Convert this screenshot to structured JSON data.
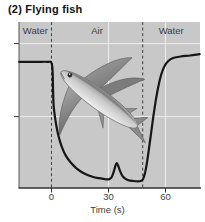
{
  "figure": {
    "title": "(2) Flying fish",
    "x_axis_label": "Time (s)",
    "x_tick_labels": [
      "0",
      "30",
      "60"
    ],
    "illustration": "flying fish"
  },
  "chart_data": {
    "type": "line",
    "title": "(2) Flying fish",
    "xlabel": "Time (s)",
    "ylabel": "",
    "x_ticks": [
      0,
      30,
      60
    ],
    "x_range_s": [
      -17,
      78
    ],
    "grid": true,
    "x_gridlines_s": [
      30,
      60
    ],
    "y_gridlines": [
      87,
      43
    ],
    "phase_boundaries_s": [
      0,
      48
    ],
    "phase_regions": [
      {
        "label": "Water",
        "from_s": -17,
        "to_s": 0
      },
      {
        "label": "Air",
        "from_s": 0,
        "to_s": 48
      },
      {
        "label": "Water",
        "from_s": 48,
        "to_s": 78
      }
    ],
    "y_unit": "relative level 0-100 (axis unlabeled)",
    "series": [
      {
        "name": "flying fish water/air profile",
        "points": [
          [
            -17,
            76
          ],
          [
            -8,
            76
          ],
          [
            -2,
            76
          ],
          [
            0,
            75.5
          ],
          [
            0.6,
            70
          ],
          [
            0.8,
            60
          ],
          [
            1.1,
            50
          ],
          [
            1.8,
            43
          ],
          [
            2.8,
            36
          ],
          [
            4,
            30
          ],
          [
            5.5,
            24.5
          ],
          [
            7.5,
            19.5
          ],
          [
            10,
            15.5
          ],
          [
            13,
            12
          ],
          [
            16,
            9.5
          ],
          [
            19,
            7.8
          ],
          [
            22,
            6.6
          ],
          [
            25,
            5.9
          ],
          [
            28,
            5.3
          ],
          [
            30,
            5.2
          ],
          [
            31.5,
            6.2
          ],
          [
            32.7,
            9.5
          ],
          [
            33.7,
            13.5
          ],
          [
            34.3,
            15
          ],
          [
            35,
            13.8
          ],
          [
            36,
            10.5
          ],
          [
            37.3,
            7.3
          ],
          [
            38.8,
            5.6
          ],
          [
            40.5,
            4.7
          ],
          [
            43,
            4.2
          ],
          [
            45.5,
            4
          ],
          [
            47,
            4.2
          ],
          [
            48.2,
            5.5
          ],
          [
            49.2,
            9
          ],
          [
            50.2,
            15
          ],
          [
            51.2,
            23
          ],
          [
            52.4,
            33
          ],
          [
            53.6,
            43
          ],
          [
            54.8,
            52
          ],
          [
            56.2,
            61
          ],
          [
            57.8,
            68.5
          ],
          [
            59.5,
            73.5
          ],
          [
            61.5,
            76.5
          ],
          [
            64,
            78.3
          ],
          [
            68,
            79.2
          ],
          [
            73,
            79.8
          ],
          [
            78,
            80.6
          ]
        ]
      }
    ]
  },
  "colors": {
    "plot_background": "#c8c8c8",
    "curve": "#161616",
    "boundary_dash": "#3f3f3f",
    "gridline": "#eeeeee",
    "axis": "#333333",
    "text": "#3b3b3b"
  }
}
